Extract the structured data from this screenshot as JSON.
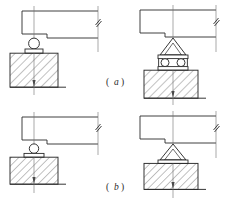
{
  "figure": {
    "line_color": "#2b2b2b",
    "hatch_color": "#555555",
    "background": "#ffffff",
    "panels": [
      {
        "id": "a",
        "caption_label": "a",
        "caption_open": "(",
        "caption_close": ")",
        "views": [
          {
            "id": "a-left",
            "name": "single-roller-bearing",
            "bearing_type": "roller",
            "roller_count": 1,
            "has_rocker": false,
            "beam_break_symbol": true
          },
          {
            "id": "a-right",
            "name": "rocker-on-double-roller-bearing",
            "bearing_type": "rocker-roller",
            "roller_count": 2,
            "has_rocker": true,
            "beam_break_symbol": true
          }
        ]
      },
      {
        "id": "b",
        "caption_label": "b",
        "caption_open": "(",
        "caption_close": ")",
        "views": [
          {
            "id": "b-left",
            "name": "single-roller-bearing-low",
            "bearing_type": "roller",
            "roller_count": 1,
            "has_rocker": false,
            "beam_break_symbol": true
          },
          {
            "id": "b-right",
            "name": "fixed-rocker-bearing",
            "bearing_type": "rocker-fixed",
            "roller_count": 0,
            "has_rocker": true,
            "beam_break_symbol": true
          }
        ]
      }
    ]
  }
}
